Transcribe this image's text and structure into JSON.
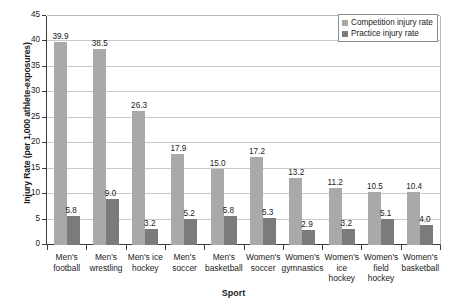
{
  "chart_data": {
    "type": "bar",
    "title": "",
    "xlabel": "Sport",
    "ylabel": "Injury Rate (per 1,000 athlete-exposures)",
    "ylim": [
      0,
      45
    ],
    "ytick_step": 5,
    "yticks": [
      "0",
      "5",
      "10",
      "15",
      "20",
      "25",
      "30",
      "35",
      "40",
      "45"
    ],
    "grid": "horizontal",
    "legend_position": "top-right",
    "categories": [
      "Men's football",
      "Men's wrestling",
      "Men's ice hockey",
      "Men's soccer",
      "Men's basketball",
      "Women's soccer",
      "Women's gymnastics",
      "Women's ice hockey",
      "Women's field hockey",
      "Women's basketball"
    ],
    "category_lines": [
      [
        "Men's",
        "football"
      ],
      [
        "Men's",
        "wrestling"
      ],
      [
        "Men's ice",
        "hockey"
      ],
      [
        "Men's",
        "soccer"
      ],
      [
        "Men's",
        "basketball"
      ],
      [
        "Women's",
        "soccer"
      ],
      [
        "Women's",
        "gymnastics"
      ],
      [
        "Women's",
        "ice",
        "hockey"
      ],
      [
        "Women's",
        "field",
        "hockey"
      ],
      [
        "Women's",
        "basketball"
      ]
    ],
    "series": [
      {
        "name": "Competition injury rate",
        "color": "#a9a9a9",
        "values": [
          39.9,
          38.5,
          26.3,
          17.9,
          15.0,
          17.2,
          13.2,
          11.2,
          10.5,
          10.4
        ],
        "labels": [
          "39.9",
          "38.5",
          "26.3",
          "17.9",
          "15.0",
          "17.2",
          "13.2",
          "11.2",
          "10.5",
          "10.4"
        ]
      },
      {
        "name": "Practice injury rate",
        "color": "#7b7b7b",
        "values": [
          5.8,
          9.0,
          3.2,
          5.2,
          5.8,
          5.3,
          2.9,
          3.2,
          5.1,
          4.0
        ],
        "labels": [
          "5.8",
          "9.0",
          "3.2",
          "5.2",
          "5.8",
          "5.3",
          "2.9",
          "3.2",
          "5.1",
          "4.0"
        ]
      }
    ]
  },
  "legend": {
    "items": [
      {
        "label": "Competition injury rate",
        "color": "#a9a9a9"
      },
      {
        "label": "Practice injury rate",
        "color": "#7b7b7b"
      }
    ]
  }
}
